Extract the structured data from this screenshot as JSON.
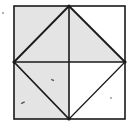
{
  "figure": {
    "square": {
      "x1": 14,
      "y1": 6,
      "x2": 125,
      "y2": 119
    },
    "center": {
      "x": 69,
      "y": 62
    },
    "stroke_color": "#1a1a1a",
    "shade_color": "#e4e4e4",
    "background_color": "#ffffff",
    "regions": [
      {
        "name": "top-left-outer",
        "shaded": true
      },
      {
        "name": "top-left-inner",
        "shaded": true
      },
      {
        "name": "top-right-inner",
        "shaded": true
      },
      {
        "name": "top-right-outer",
        "shaded": false
      },
      {
        "name": "bottom-left-outer",
        "shaded": true
      },
      {
        "name": "bottom-left-inner",
        "shaded": true
      },
      {
        "name": "bottom-right-inner",
        "shaded": false
      },
      {
        "name": "bottom-right-outer",
        "shaded": false
      }
    ]
  }
}
